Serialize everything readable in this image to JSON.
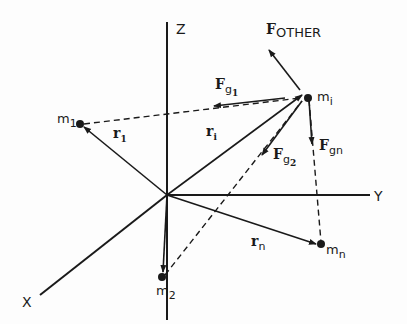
{
  "diagram": {
    "type": "gravitational-force-vectors-3d",
    "axes": {
      "x": "X",
      "y": "Y",
      "z": "Z"
    },
    "masses": [
      {
        "id": "m1",
        "label": "m",
        "sub": "1"
      },
      {
        "id": "m2",
        "label": "m",
        "sub": "2"
      },
      {
        "id": "mi",
        "label": "m",
        "sub": "i"
      },
      {
        "id": "mn",
        "label": "m",
        "sub": "n"
      }
    ],
    "position_vectors": [
      {
        "id": "r1",
        "label": "r",
        "sub": "1"
      },
      {
        "id": "ri",
        "label": "r",
        "sub": "i"
      },
      {
        "id": "rn",
        "label": "r",
        "sub": "n"
      }
    ],
    "forces": [
      {
        "id": "F_other",
        "label": "F",
        "sub": "OTHER"
      },
      {
        "id": "F_g1",
        "label": "F",
        "sub": "g",
        "subsub": "1"
      },
      {
        "id": "F_g2",
        "label": "F",
        "sub": "g",
        "subsub": "2"
      },
      {
        "id": "F_gn",
        "label": "F",
        "sub": "gn"
      }
    ],
    "colors": {
      "ink": "#1a1a1a",
      "background": "#fdfdfd"
    }
  }
}
